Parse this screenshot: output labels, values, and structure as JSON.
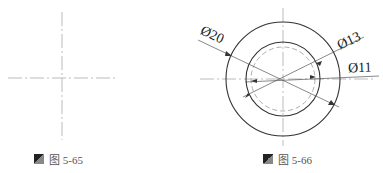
{
  "figures": [
    {
      "id": "fig-5-65",
      "caption": "图 5-65",
      "content": "centerline crosshair"
    },
    {
      "id": "fig-5-66",
      "caption": "图 5-66",
      "content": "concentric circles with diameter dimensions",
      "dimensions": {
        "outer": "Ø20",
        "inner": "Ø13",
        "hidden": "Ø11"
      }
    }
  ],
  "colors": {
    "line": "#333333",
    "centerline": "#999999",
    "caption": "#555555"
  }
}
